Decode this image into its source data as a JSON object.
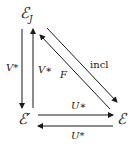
{
  "nodes": {
    "top": {
      "name": "ℰ",
      "sub": "J"
    },
    "bottom_left": {
      "name": "ℰ′"
    },
    "bottom_right": {
      "name": "ℰ"
    }
  },
  "edges": {
    "v_star_down": {
      "label": "V*",
      "from": "top",
      "to": "bottom_left"
    },
    "v_lower_star_up": {
      "label": "V∗",
      "from": "bottom_left",
      "to": "top"
    },
    "F": {
      "label": "F",
      "from": "bottom_right",
      "to": "top"
    },
    "incl": {
      "label": "incl",
      "from": "top",
      "to": "bottom_right"
    },
    "u_lower_star": {
      "label": "U∗",
      "from": "bottom_left",
      "to": "bottom_right"
    },
    "u_upper_star": {
      "label": "U*",
      "from": "bottom_right",
      "to": "bottom_left"
    }
  },
  "colors": {
    "ink": "#1a1a1a",
    "background": "#ffffff"
  }
}
